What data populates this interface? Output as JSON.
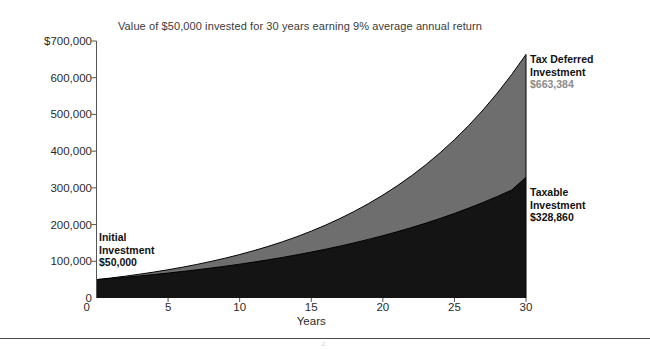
{
  "chart_data": {
    "type": "area",
    "title": "Value of $50,000 invested for 30 years earning 9% average annual return",
    "xlabel": "Years",
    "ylabel": "",
    "xlim": [
      0,
      30
    ],
    "ylim": [
      0,
      700000
    ],
    "grid": false,
    "legend_position": "right-inline-annotations",
    "x": [
      0,
      1,
      2,
      3,
      4,
      5,
      6,
      7,
      8,
      9,
      10,
      11,
      12,
      13,
      14,
      15,
      16,
      17,
      18,
      19,
      20,
      21,
      22,
      23,
      24,
      25,
      26,
      27,
      28,
      29,
      30
    ],
    "series": [
      {
        "name": "Tax Deferred Investment",
        "color": "#6e6e6e",
        "end_value": 663384,
        "end_value_label": "$663,384",
        "values": [
          50000,
          54500,
          59405,
          64751,
          70578,
          76931,
          83855,
          91402,
          99628,
          108595,
          118368,
          129021,
          140633,
          153290,
          167087,
          182125,
          198517,
          216383,
          235858,
          257085,
          280221,
          305441,
          332930,
          362894,
          395555,
          431155,
          469959,
          512255,
          558358,
          608610,
          663384
        ]
      },
      {
        "name": "Taxable Investment",
        "color": "#141414",
        "end_value": 328860,
        "end_value_label": "$328,860",
        "values": [
          50000,
          53150,
          56498,
          60057,
          63841,
          67863,
          72139,
          76684,
          81515,
          86650,
          92109,
          97912,
          104081,
          110638,
          117608,
          125018,
          132894,
          141266,
          150166,
          159626,
          169683,
          180373,
          191736,
          203816,
          216656,
          230305,
          244814,
          260237,
          276631,
          294059,
          328860
        ]
      }
    ],
    "yticks": [
      {
        "value": 700000,
        "label": "$700,000"
      },
      {
        "value": 600000,
        "label": "600,000"
      },
      {
        "value": 500000,
        "label": "500,000"
      },
      {
        "value": 400000,
        "label": "400,000"
      },
      {
        "value": 300000,
        "label": "300,000"
      },
      {
        "value": 200000,
        "label": "200,000"
      },
      {
        "value": 100000,
        "label": "100,000"
      },
      {
        "value": 0,
        "label": "0"
      }
    ],
    "xticks": [
      {
        "value": 0,
        "label": "0"
      },
      {
        "value": 5,
        "label": "5"
      },
      {
        "value": 10,
        "label": "10"
      },
      {
        "value": 15,
        "label": "15"
      },
      {
        "value": 20,
        "label": "20"
      },
      {
        "value": 25,
        "label": "25"
      },
      {
        "value": 30,
        "label": "30"
      }
    ],
    "annotations": [
      {
        "id": "initial",
        "line1": "Initial",
        "line2": "Investment",
        "value": "$50,000"
      },
      {
        "id": "tax-deferred",
        "line1": "Tax Deferred",
        "line2": "Investment",
        "value": "$663,384"
      },
      {
        "id": "taxable",
        "line1": "Taxable",
        "line2": "Investment",
        "value": "$328,860"
      }
    ]
  },
  "colors": {
    "tax_deferred_fill": "#6e6e6e",
    "taxable_fill": "#141414",
    "axis": "#555555",
    "title_text": "#3a3a3a",
    "gray_value_text": "#8b8b8b",
    "rule": "#4a4a4a"
  },
  "footer": {
    "page_marker": "2"
  }
}
